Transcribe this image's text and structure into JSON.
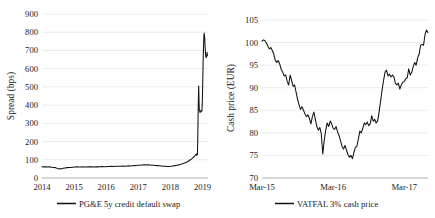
{
  "chart_data": [
    {
      "type": "line",
      "id": "pge-cds",
      "title": "",
      "xlabel": "",
      "ylabel": "Spread (bps)",
      "ylim": [
        0,
        900
      ],
      "ytick_step": 100,
      "ytick_labels": [
        "0",
        "100",
        "200",
        "300",
        "400",
        "500",
        "600",
        "700",
        "800",
        "900"
      ],
      "xtick_labels": [
        "2014",
        "2015",
        "2016",
        "2017",
        "2018",
        "2019"
      ],
      "xlim": [
        2014,
        2019.17
      ],
      "grid": true,
      "legend_position": "bottom",
      "series": [
        {
          "name": "PG&E 5y credit default swap",
          "color": "#111111",
          "x": [
            2014.0,
            2014.06,
            2014.12,
            2014.18,
            2014.24,
            2014.3,
            2014.36,
            2014.42,
            2014.48,
            2014.54,
            2014.6,
            2014.66,
            2014.72,
            2014.78,
            2014.84,
            2014.9,
            2014.96,
            2015.02,
            2015.08,
            2015.14,
            2015.2,
            2015.26,
            2015.32,
            2015.38,
            2015.44,
            2015.5,
            2015.56,
            2015.62,
            2015.68,
            2015.74,
            2015.8,
            2015.86,
            2015.92,
            2015.98,
            2016.04,
            2016.1,
            2016.16,
            2016.22,
            2016.28,
            2016.34,
            2016.4,
            2016.46,
            2016.52,
            2016.58,
            2016.64,
            2016.7,
            2016.76,
            2016.82,
            2016.88,
            2016.94,
            2017.0,
            2017.06,
            2017.12,
            2017.18,
            2017.24,
            2017.3,
            2017.36,
            2017.42,
            2017.48,
            2017.54,
            2017.6,
            2017.66,
            2017.72,
            2017.78,
            2017.84,
            2017.9,
            2017.96,
            2018.02,
            2018.08,
            2018.14,
            2018.2,
            2018.26,
            2018.32,
            2018.38,
            2018.44,
            2018.5,
            2018.56,
            2018.62,
            2018.68,
            2018.74,
            2018.78,
            2018.8,
            2018.82,
            2018.84,
            2018.85,
            2018.86,
            2018.87,
            2018.88,
            2018.885,
            2018.89,
            2018.895,
            2018.9,
            2018.91,
            2018.92,
            2018.93,
            2018.94,
            2018.95,
            2018.96,
            2018.97,
            2018.98,
            2018.99,
            2019.0,
            2019.01,
            2019.02,
            2019.03,
            2019.04,
            2019.05,
            2019.06,
            2019.07,
            2019.08,
            2019.09,
            2019.1,
            2019.11,
            2019.12,
            2019.13,
            2019.14,
            2019.15
          ],
          "y": [
            62,
            61,
            62,
            60,
            61,
            59,
            58,
            57,
            52,
            50,
            51,
            53,
            55,
            57,
            58,
            58,
            59,
            60,
            61,
            60,
            60,
            61,
            60,
            60,
            61,
            62,
            61,
            60,
            62,
            61,
            62,
            63,
            62,
            62,
            63,
            63,
            64,
            63,
            64,
            65,
            64,
            65,
            66,
            65,
            66,
            67,
            66,
            67,
            68,
            69,
            70,
            70,
            71,
            72,
            71,
            72,
            71,
            70,
            70,
            69,
            68,
            67,
            66,
            65,
            64,
            63,
            63,
            64,
            66,
            68,
            70,
            72,
            75,
            78,
            82,
            86,
            92,
            100,
            108,
            118,
            126,
            132,
            124,
            128,
            200,
            330,
            430,
            505,
            470,
            420,
            390,
            372,
            368,
            360,
            366,
            362,
            370,
            366,
            372,
            368,
            400,
            470,
            560,
            650,
            720,
            770,
            795,
            780,
            760,
            720,
            690,
            670,
            660,
            672,
            665,
            690,
            672
          ]
        }
      ]
    },
    {
      "type": "line",
      "id": "vattenfall-cash-price",
      "title": "",
      "xlabel": "",
      "ylabel": "Cash price (EUR)",
      "ylim": [
        70,
        105
      ],
      "ytick_step": 5,
      "ytick_labels": [
        "70",
        "75",
        "80",
        "85",
        "90",
        "95",
        "100",
        "105"
      ],
      "xtick_labels": [
        "Mar-15",
        "Mar-16",
        "Mar-17"
      ],
      "xlim": [
        0,
        28
      ],
      "grid": true,
      "legend_position": "bottom",
      "series": [
        {
          "name": "VATFAL 3% cash price",
          "color": "#111111",
          "x": [
            0.0,
            0.25,
            0.5,
            0.75,
            1.0,
            1.25,
            1.5,
            1.75,
            2.0,
            2.25,
            2.5,
            2.75,
            3.0,
            3.25,
            3.5,
            3.75,
            4.0,
            4.25,
            4.5,
            4.75,
            5.0,
            5.25,
            5.5,
            5.75,
            6.0,
            6.25,
            6.5,
            6.75,
            7.0,
            7.25,
            7.5,
            7.75,
            8.0,
            8.25,
            8.5,
            8.75,
            9.0,
            9.25,
            9.5,
            9.75,
            10.0,
            10.25,
            10.5,
            10.75,
            11.0,
            11.25,
            11.5,
            11.75,
            12.0,
            12.25,
            12.5,
            12.75,
            13.0,
            13.25,
            13.5,
            13.75,
            14.0,
            14.25,
            14.5,
            14.75,
            15.0,
            15.25,
            15.5,
            15.75,
            16.0,
            16.25,
            16.5,
            16.75,
            17.0,
            17.25,
            17.5,
            17.75,
            18.0,
            18.25,
            18.5,
            18.75,
            19.0,
            19.25,
            19.5,
            19.75,
            20.0,
            20.25,
            20.5,
            20.75,
            21.0,
            21.25,
            21.5,
            21.75,
            22.0,
            22.25,
            22.5,
            22.75,
            23.0,
            23.25,
            23.5,
            23.75,
            24.0,
            24.25,
            24.5,
            24.75,
            25.0,
            25.25,
            25.5,
            25.75,
            26.0,
            26.25,
            26.5,
            26.75,
            27.0,
            27.25,
            27.5,
            27.75,
            28.0
          ],
          "y": [
            100.3,
            100.6,
            100.4,
            99.9,
            99.2,
            98.6,
            98.9,
            98.2,
            97.4,
            96.0,
            95.6,
            96.0,
            95.2,
            94.0,
            93.4,
            92.6,
            92.8,
            91.4,
            90.6,
            92.8,
            91.6,
            90.3,
            90.6,
            89.0,
            87.4,
            86.2,
            85.2,
            85.8,
            85.0,
            84.2,
            83.6,
            84.0,
            83.2,
            82.0,
            83.6,
            84.6,
            83.0,
            81.4,
            80.6,
            81.2,
            79.8,
            75.3,
            78.4,
            80.6,
            82.2,
            81.4,
            82.6,
            82.0,
            81.0,
            80.8,
            81.4,
            80.2,
            79.4,
            78.2,
            77.0,
            76.4,
            77.2,
            76.2,
            75.2,
            74.6,
            75.0,
            74.3,
            75.6,
            76.8,
            77.0,
            78.6,
            80.4,
            80.0,
            81.0,
            82.2,
            81.8,
            82.4,
            81.6,
            82.0,
            83.8,
            82.6,
            83.0,
            82.2,
            82.6,
            84.6,
            87.0,
            89.4,
            91.6,
            93.4,
            93.9,
            92.6,
            93.0,
            92.4,
            92.8,
            92.4,
            91.0,
            90.6,
            91.0,
            89.7,
            90.6,
            91.2,
            91.4,
            92.0,
            92.2,
            94.2,
            92.8,
            93.4,
            94.6,
            95.6,
            95.0,
            96.6,
            97.4,
            99.4,
            99.6,
            99.4,
            101.8,
            102.8,
            102.2
          ]
        }
      ]
    }
  ]
}
